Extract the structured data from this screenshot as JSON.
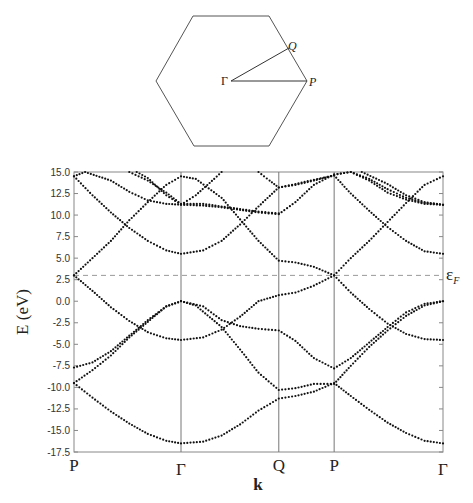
{
  "brillouin_zone": {
    "shape": "hexagon",
    "labels": {
      "gamma": "Γ",
      "q": "Q",
      "p": "P"
    }
  },
  "chart_data": {
    "type": "scatter",
    "title": "",
    "xlabel": "k",
    "ylabel": "E (eV)",
    "ylim": [
      -17.5,
      15.0
    ],
    "yticks": [
      "15.0",
      "12.5",
      "10.0",
      "7.5",
      "5.0",
      "2.5",
      "0.0",
      "-2.5",
      "-5.0",
      "-7.5",
      "-10.0",
      "-12.5",
      "-15.0",
      "-17.5"
    ],
    "ytick_values": [
      15.0,
      12.5,
      10.0,
      7.5,
      5.0,
      2.5,
      0.0,
      -2.5,
      -5.0,
      -7.5,
      -10.0,
      -12.5,
      -15.0,
      -17.5
    ],
    "kpoints": [
      {
        "label": "P",
        "k": 0.0
      },
      {
        "label": "Γ",
        "k": 0.29
      },
      {
        "label": "Q",
        "k": 0.555
      },
      {
        "label": "P",
        "k": 0.705
      },
      {
        "label": "Γ",
        "k": 1.0
      }
    ],
    "fermi_level": {
      "label": "ε",
      "sub": "F",
      "value": 3.0
    },
    "bands": [
      {
        "name": "band-1",
        "points": [
          [
            0,
            -9.5
          ],
          [
            0.05,
            -11.2
          ],
          [
            0.1,
            -12.8
          ],
          [
            0.15,
            -14.2
          ],
          [
            0.2,
            -15.4
          ],
          [
            0.25,
            -16.2
          ],
          [
            0.29,
            -16.5
          ],
          [
            0.35,
            -16.3
          ],
          [
            0.4,
            -15.6
          ],
          [
            0.45,
            -14.3
          ],
          [
            0.5,
            -12.7
          ],
          [
            0.555,
            -11.3
          ],
          [
            0.6,
            -11.0
          ],
          [
            0.65,
            -10.5
          ],
          [
            0.705,
            -9.5
          ],
          [
            0.75,
            -11.0
          ],
          [
            0.8,
            -12.6
          ],
          [
            0.85,
            -14.1
          ],
          [
            0.9,
            -15.3
          ],
          [
            0.95,
            -16.2
          ],
          [
            1.0,
            -16.5
          ]
        ]
      },
      {
        "name": "band-2",
        "points": [
          [
            0,
            -9.5
          ],
          [
            0.05,
            -8.0
          ],
          [
            0.1,
            -6.3
          ],
          [
            0.15,
            -4.2
          ],
          [
            0.2,
            -2.4
          ],
          [
            0.25,
            -0.6
          ],
          [
            0.29,
            0.0
          ],
          [
            0.33,
            -0.5
          ],
          [
            0.4,
            -3.0
          ],
          [
            0.45,
            -5.6
          ],
          [
            0.5,
            -8.3
          ],
          [
            0.555,
            -10.3
          ],
          [
            0.6,
            -10.1
          ],
          [
            0.65,
            -9.6
          ],
          [
            0.705,
            -9.6
          ],
          [
            0.75,
            -7.5
          ],
          [
            0.8,
            -5.3
          ],
          [
            0.85,
            -3.4
          ],
          [
            0.9,
            -1.7
          ],
          [
            0.95,
            -0.5
          ],
          [
            1.0,
            0.0
          ]
        ]
      },
      {
        "name": "band-3",
        "points": [
          [
            0,
            -7.7
          ],
          [
            0.05,
            -7.1
          ],
          [
            0.1,
            -5.8
          ],
          [
            0.15,
            -4.0
          ],
          [
            0.2,
            -2.2
          ],
          [
            0.25,
            -0.6
          ],
          [
            0.29,
            0.0
          ],
          [
            0.35,
            -0.6
          ],
          [
            0.4,
            -2.2
          ],
          [
            0.45,
            -2.9
          ],
          [
            0.5,
            -3.2
          ],
          [
            0.555,
            -3.4
          ],
          [
            0.6,
            -4.6
          ],
          [
            0.65,
            -6.6
          ],
          [
            0.705,
            -7.8
          ],
          [
            0.75,
            -6.6
          ],
          [
            0.8,
            -4.8
          ],
          [
            0.85,
            -3.0
          ],
          [
            0.9,
            -1.3
          ],
          [
            0.95,
            -0.3
          ],
          [
            1.0,
            0.0
          ]
        ]
      },
      {
        "name": "band-4",
        "points": [
          [
            0,
            3.0
          ],
          [
            0.05,
            1.2
          ],
          [
            0.1,
            -0.7
          ],
          [
            0.15,
            -2.3
          ],
          [
            0.2,
            -3.6
          ],
          [
            0.25,
            -4.3
          ],
          [
            0.29,
            -4.5
          ],
          [
            0.35,
            -4.2
          ],
          [
            0.4,
            -3.3
          ],
          [
            0.45,
            -1.8
          ],
          [
            0.5,
            0.0
          ],
          [
            0.555,
            0.7
          ],
          [
            0.6,
            1.0
          ],
          [
            0.65,
            1.8
          ],
          [
            0.705,
            3.0
          ],
          [
            0.75,
            1.0
          ],
          [
            0.8,
            -0.9
          ],
          [
            0.85,
            -2.6
          ],
          [
            0.9,
            -3.8
          ],
          [
            0.95,
            -4.4
          ],
          [
            1.0,
            -4.5
          ]
        ]
      },
      {
        "name": "band-5",
        "points": [
          [
            0,
            3.0
          ],
          [
            0.05,
            5.0
          ],
          [
            0.1,
            7.0
          ],
          [
            0.15,
            9.4
          ],
          [
            0.2,
            11.5
          ],
          [
            0.25,
            13.5
          ],
          [
            0.29,
            14.5
          ],
          [
            0.33,
            14.2
          ],
          [
            0.4,
            12.0
          ],
          [
            0.45,
            9.5
          ],
          [
            0.5,
            7.0
          ],
          [
            0.555,
            4.7
          ],
          [
            0.6,
            4.5
          ],
          [
            0.65,
            4.0
          ],
          [
            0.705,
            3.0
          ],
          [
            0.75,
            5.0
          ],
          [
            0.8,
            7.0
          ],
          [
            0.85,
            9.2
          ],
          [
            0.9,
            11.4
          ],
          [
            0.95,
            13.5
          ],
          [
            1.0,
            14.5
          ]
        ]
      },
      {
        "name": "band-6",
        "points": [
          [
            0,
            14.5
          ],
          [
            0.05,
            12.3
          ],
          [
            0.1,
            10.3
          ],
          [
            0.15,
            8.5
          ],
          [
            0.2,
            7.0
          ],
          [
            0.25,
            5.9
          ],
          [
            0.29,
            5.5
          ],
          [
            0.35,
            5.9
          ],
          [
            0.4,
            7.0
          ],
          [
            0.45,
            8.9
          ],
          [
            0.5,
            11.0
          ],
          [
            0.555,
            13.2
          ],
          [
            0.6,
            13.5
          ],
          [
            0.65,
            14.0
          ],
          [
            0.705,
            14.6
          ],
          [
            0.75,
            12.5
          ],
          [
            0.8,
            10.5
          ],
          [
            0.85,
            8.6
          ],
          [
            0.9,
            7.0
          ],
          [
            0.95,
            5.8
          ],
          [
            1.0,
            5.5
          ]
        ]
      },
      {
        "name": "band-7",
        "points": [
          [
            0,
            14.5
          ],
          [
            0.03,
            15.0
          ],
          [
            0.1,
            14.0
          ],
          [
            0.15,
            12.7
          ],
          [
            0.2,
            11.7
          ],
          [
            0.25,
            11.3
          ],
          [
            0.29,
            11.2
          ],
          [
            0.35,
            11.1
          ],
          [
            0.4,
            10.9
          ],
          [
            0.45,
            10.6
          ],
          [
            0.5,
            10.3
          ],
          [
            0.555,
            10.1
          ],
          [
            0.6,
            11.5
          ],
          [
            0.65,
            13.5
          ],
          [
            0.705,
            14.7
          ],
          [
            0.75,
            15.0
          ],
          [
            0.8,
            14.2
          ],
          [
            0.85,
            13.0
          ],
          [
            0.9,
            12.0
          ],
          [
            0.95,
            11.4
          ],
          [
            1.0,
            11.2
          ]
        ]
      },
      {
        "name": "band-8",
        "points": [
          [
            0.17,
            15.0
          ],
          [
            0.2,
            14.3
          ],
          [
            0.25,
            12.3
          ],
          [
            0.29,
            11.2
          ],
          [
            0.33,
            12.3
          ],
          [
            0.38,
            14.2
          ],
          [
            0.4,
            15.0
          ]
        ]
      },
      {
        "name": "band-9",
        "points": [
          [
            0.15,
            15.0
          ],
          [
            0.2,
            14.0
          ],
          [
            0.25,
            12.6
          ],
          [
            0.29,
            11.3
          ],
          [
            0.35,
            11.3
          ],
          [
            0.4,
            11.0
          ],
          [
            0.45,
            10.7
          ],
          [
            0.5,
            10.4
          ],
          [
            0.555,
            10.2
          ]
        ]
      },
      {
        "name": "band-10",
        "points": [
          [
            0.5,
            15.0
          ],
          [
            0.53,
            14.0
          ],
          [
            0.555,
            13.2
          ],
          [
            0.6,
            13.6
          ],
          [
            0.65,
            14.1
          ],
          [
            0.705,
            14.6
          ]
        ]
      },
      {
        "name": "band-11",
        "points": [
          [
            0.705,
            14.7
          ],
          [
            0.75,
            15.0
          ],
          [
            0.8,
            14.0
          ],
          [
            0.85,
            12.6
          ],
          [
            0.9,
            11.8
          ],
          [
            0.95,
            11.3
          ],
          [
            1.0,
            11.2
          ]
        ]
      },
      {
        "name": "band-12",
        "points": [
          [
            0.78,
            15.0
          ],
          [
            0.85,
            13.6
          ],
          [
            0.9,
            12.3
          ],
          [
            0.95,
            11.5
          ],
          [
            1.0,
            11.2
          ]
        ]
      }
    ]
  }
}
